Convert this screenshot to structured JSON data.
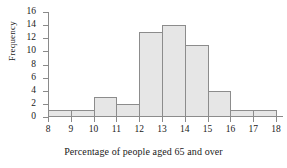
{
  "chart_data": {
    "type": "bar",
    "title": "",
    "subtitle": "",
    "xlabel": "Percentage of people aged 65 and over",
    "ylabel": "Frequency",
    "categories": [
      "8-9",
      "9-10",
      "10-11",
      "11-12",
      "12-13",
      "13-14",
      "14-15",
      "15-16",
      "16-17",
      "17-18"
    ],
    "bin_edges": [
      8,
      9,
      10,
      11,
      12,
      13,
      14,
      15,
      16,
      17,
      18
    ],
    "values": [
      1,
      1,
      3,
      2,
      13,
      14,
      11,
      4,
      1,
      1
    ],
    "xlim": [
      8,
      18
    ],
    "ylim": [
      0,
      16
    ],
    "xticks": [
      "8",
      "9",
      "10",
      "11",
      "12",
      "13",
      "14",
      "15",
      "16",
      "17",
      "18"
    ],
    "xtick_values": [
      8,
      9,
      10,
      11,
      12,
      13,
      14,
      15,
      16,
      17,
      18
    ],
    "yticks": [
      "0",
      "2",
      "4",
      "6",
      "8",
      "10",
      "12",
      "14",
      "16"
    ],
    "ytick_values": [
      0,
      2,
      4,
      6,
      8,
      10,
      12,
      14,
      16
    ],
    "grid": false,
    "legend": null,
    "legend_position": "none",
    "annotations": [],
    "colors": {
      "bar_fill": "#e6e6e6",
      "bar_edge": "#8c8c8c",
      "axis": "#8a8a8a",
      "text": "#1a1a1a",
      "background": "#ffffff"
    }
  }
}
